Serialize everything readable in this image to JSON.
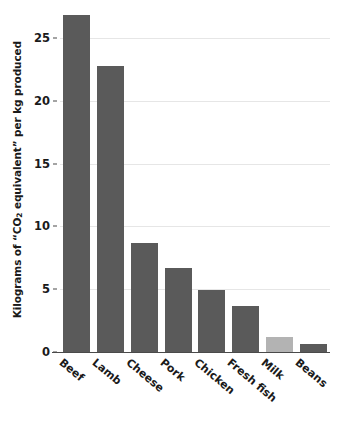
{
  "chart_data": {
    "type": "bar",
    "title": "",
    "subtitle": "",
    "xlabel": "",
    "ylabel": "Kilograms of \"CO2 equivalent\" per kg produced",
    "ylabel_parts": {
      "before": "Kilograms of “CO",
      "sub": "2",
      "after": " equivalent” per kg produced"
    },
    "categories": [
      "Beef",
      "Lamb",
      "Cheese",
      "Pork",
      "Chicken",
      "Fresh fish",
      "Milk",
      "Beans"
    ],
    "values": [
      26.8,
      22.8,
      8.7,
      6.7,
      4.9,
      3.7,
      1.2,
      0.6
    ],
    "bar_colors": [
      "#5a5a5a",
      "#5a5a5a",
      "#5a5a5a",
      "#5a5a5a",
      "#5a5a5a",
      "#5a5a5a",
      "#b3b3b3",
      "#5a5a5a"
    ],
    "highlighted_category": "Milk",
    "ylim": [
      0,
      27.6
    ],
    "yticks": [
      0,
      5,
      10,
      15,
      20,
      25
    ],
    "ytick_labels": [
      "0",
      "5",
      "10",
      "15",
      "20",
      "25"
    ],
    "grid": true,
    "grid_axis": "y",
    "grid_color": "#e6e6e6",
    "legend": null,
    "legend_position": "none",
    "xtick_rotation": 40,
    "background_color": "#ffffff",
    "axis_color": "#4a4a4a",
    "text_color": "#1a1a1a"
  }
}
